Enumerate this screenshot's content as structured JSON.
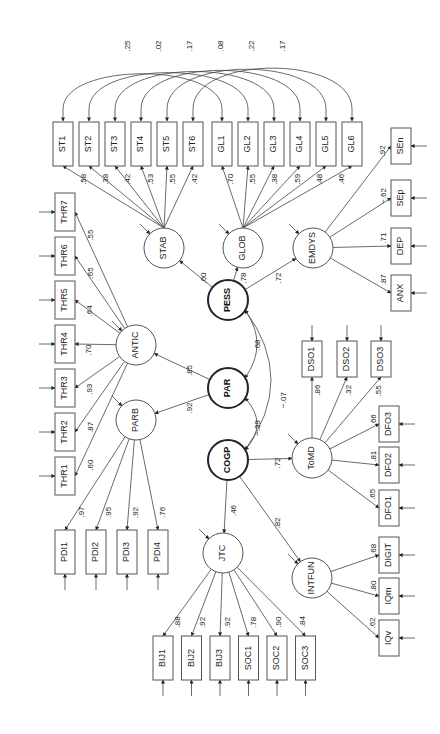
{
  "diagram": {
    "type": "structural-equation-model",
    "orientation": "rotated-90",
    "core_latents": [
      "PESS",
      "PAR",
      "COGP"
    ],
    "latents": [
      "STAB",
      "GLOB",
      "EMDYS",
      "ANTIC",
      "PARB",
      "ToMD",
      "JTC",
      "INTFUN"
    ],
    "paths": [
      {
        "from": "PESS",
        "to": "STAB",
        "label": ".60"
      },
      {
        "from": "PESS",
        "to": "GLOB",
        "label": ".78"
      },
      {
        "from": "PESS",
        "to": "EMDYS",
        "label": ".72"
      },
      {
        "from": "PAR",
        "to": "ANTIC",
        "label": ".85"
      },
      {
        "from": "PAR",
        "to": "PARB",
        "label": ".92"
      },
      {
        "from": "COGP",
        "to": "ToMD",
        "label": ".72"
      },
      {
        "from": "COGP",
        "to": "JTC",
        "label": ".46"
      },
      {
        "from": "COGP",
        "to": "INTFUN",
        "label": ".82"
      }
    ],
    "correlations_core": [
      {
        "a": "PESS",
        "b": "PAR",
        "label": ".68"
      },
      {
        "a": "PAR",
        "b": "COGP",
        "label": "−.39"
      },
      {
        "a": "PESS",
        "b": "COGP",
        "label": "−.07"
      }
    ],
    "indicators": {
      "STAB": [
        {
          "name": "ST1",
          "label": ".58"
        },
        {
          "name": "ST2",
          "label": ".38"
        },
        {
          "name": "ST3",
          "label": ".42"
        },
        {
          "name": "ST4",
          "label": ".53"
        },
        {
          "name": "ST5",
          "label": ".55"
        },
        {
          "name": "ST6",
          "label": ".42"
        }
      ],
      "GLOB": [
        {
          "name": "GL1",
          "label": ".70"
        },
        {
          "name": "GL2",
          "label": ".55"
        },
        {
          "name": "GL3",
          "label": ".38"
        },
        {
          "name": "GL4",
          "label": ".59"
        },
        {
          "name": "GL5",
          "label": ".48"
        },
        {
          "name": "GL6",
          "label": ".46"
        }
      ],
      "EMDYS": [
        {
          "name": "SEn",
          "label": ".92"
        },
        {
          "name": "SEp",
          "label": "−.62"
        },
        {
          "name": "DEP",
          "label": ".71"
        },
        {
          "name": "ANX",
          "label": ".87"
        }
      ],
      "ANTIC": [
        {
          "name": "THR7",
          "label": ".55"
        },
        {
          "name": "THR6",
          "label": ".65"
        },
        {
          "name": "THR5",
          "label": ".64"
        },
        {
          "name": "THR4",
          "label": ".70"
        },
        {
          "name": "THR3",
          "label": ".93"
        },
        {
          "name": "THR2",
          "label": ".87"
        },
        {
          "name": "THR1",
          "label": ".60"
        }
      ],
      "PARB": [
        {
          "name": "PDI1",
          "label": ".97"
        },
        {
          "name": "PDI2",
          "label": ".95"
        },
        {
          "name": "PDI3",
          "label": ".92"
        },
        {
          "name": "PDI4",
          "label": ".76"
        }
      ],
      "ToMD": [
        {
          "name": "DSO1",
          "label": ".86"
        },
        {
          "name": "DSO2",
          "label": ".32"
        },
        {
          "name": "DSO3",
          "label": ".55"
        },
        {
          "name": "DFO3",
          "label": ".66"
        },
        {
          "name": "DFO2",
          "label": ".81"
        },
        {
          "name": "DFO1",
          "label": ".65"
        }
      ],
      "JTC": [
        {
          "name": "BIJ1",
          "label": ".88"
        },
        {
          "name": "BIJ2",
          "label": ".92"
        },
        {
          "name": "BIJ3",
          "label": ".92"
        },
        {
          "name": "SOC1",
          "label": ".78"
        },
        {
          "name": "SOC2",
          "label": ".90"
        },
        {
          "name": "SOC3",
          "label": ".84"
        }
      ],
      "INTFUN": [
        {
          "name": "DIGIT",
          "label": ".68"
        },
        {
          "name": "IQm",
          "label": ".80"
        },
        {
          "name": "IQv",
          "label": ".62"
        }
      ]
    },
    "error_correlations": [
      {
        "a": "ST1",
        "b": "GL1",
        "label": ".25"
      },
      {
        "a": "ST2",
        "b": "GL2",
        "label": ".02"
      },
      {
        "a": "ST3",
        "b": "GL3",
        "label": ".17"
      },
      {
        "a": "ST4",
        "b": "GL4",
        "label": ".08"
      },
      {
        "a": "ST5",
        "b": "GL5",
        "label": ".22"
      },
      {
        "a": "ST6",
        "b": "GL6",
        "label": ".17"
      }
    ]
  }
}
